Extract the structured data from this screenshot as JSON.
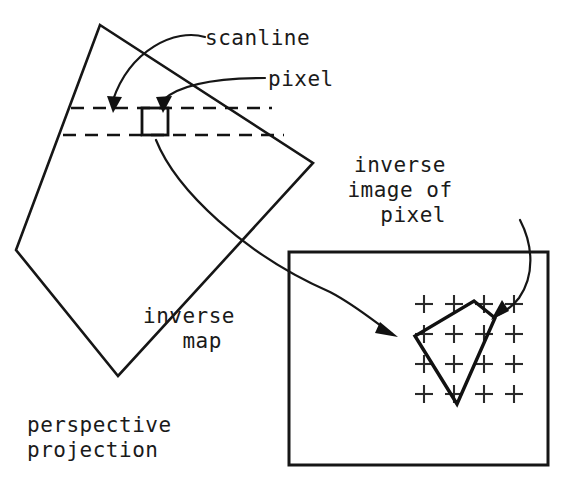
{
  "figure": {
    "width": 563,
    "height": 487,
    "background": "#ffffff",
    "ink_color": "#161616"
  },
  "labels": {
    "scanline": "scanline",
    "pixel": "pixel",
    "inverse_image_line1": "inverse",
    "inverse_image_line2": "image of",
    "inverse_image_line3": "pixel",
    "inverse_map_line1": "inverse",
    "inverse_map_line2": "map",
    "perspective_line1": "perspective",
    "perspective_line2": "projection"
  },
  "shapes": {
    "perspective_quad": {
      "name": "perspective-projection-quadrilateral",
      "points": "100,25 313,163 118,376 16,250"
    },
    "pixel_square": {
      "name": "pixel-square",
      "x": 142,
      "y": 108,
      "width": 26,
      "height": 27
    },
    "scanline_top": {
      "name": "scanline-upper-dashed",
      "x1": 71,
      "y1": 108,
      "x2": 272,
      "y2": 108
    },
    "scanline_bottom": {
      "name": "scanline-lower-dashed",
      "x1": 63,
      "y1": 135,
      "x2": 284,
      "y2": 135
    },
    "texture_box": {
      "name": "texture-space-box",
      "x": 289,
      "y": 252,
      "width": 259,
      "height": 213
    },
    "inverse_polygon": {
      "name": "inverse-image-polygon",
      "points": "474,301 495,318 457,404 415,336"
    },
    "crosshair_grid": {
      "name": "texel-crosshair-grid",
      "origin_x": 424,
      "origin_y": 304,
      "step_x": 30,
      "step_y": 30,
      "cols": 4,
      "rows": 4,
      "arm": 9
    }
  },
  "leaders": {
    "scanline_leader": {
      "name": "scanline-leader-curve",
      "path": "M 205,37 C 175,28 130,50 113,100",
      "arrow": "113,113 107,96 122,97"
    },
    "pixel_leader": {
      "name": "pixel-leader-curve",
      "path": "M 265,78 C 215,78 180,84 163,100",
      "arrow": "163,113 156,97 172,96"
    },
    "inverse_map_leader": {
      "name": "inverse-map-leader-curve",
      "path": "M 156,140 C 176,190 245,255 330,292 C 355,305 375,322 392,334"
    },
    "inverse_map_arrow": {
      "name": "inverse-map-arrowhead",
      "points": "398,337 375,333 380,322"
    },
    "inverse_image_leader": {
      "name": "inverse-image-leader-curve",
      "path": "M 520,220 C 533,245 535,275 519,298 C 510,310 500,314 494,317"
    },
    "inverse_image_arrow": {
      "name": "inverse-image-arrowhead",
      "points": "491,320 502,300 509,311"
    }
  },
  "text_positions": {
    "scanline": {
      "x": 205,
      "y": 45
    },
    "pixel": {
      "x": 268,
      "y": 86
    },
    "inverse_image": {
      "x": 446,
      "y": 172,
      "line_height": 25,
      "anchor": "middle"
    },
    "inverse_map": {
      "x": 235,
      "y": 323,
      "line_height": 25,
      "anchor": "middle"
    },
    "perspective": {
      "x": 27,
      "y": 432,
      "line_height": 25,
      "anchor": "start"
    }
  }
}
